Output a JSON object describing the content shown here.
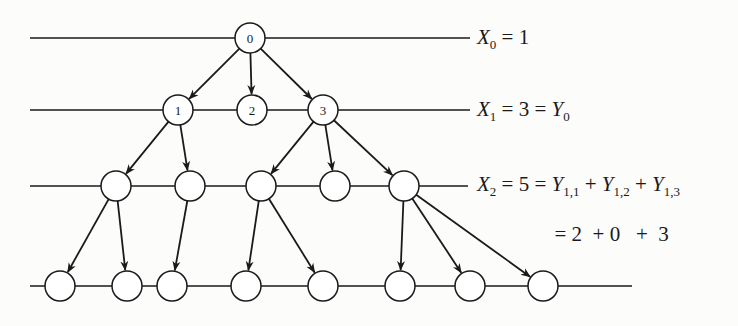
{
  "diagram": {
    "colors": {
      "line": "#1a1a1a",
      "background": "#fcfcfa",
      "node_fill": "#ffffff"
    },
    "generation_lines": [
      {
        "y": 38,
        "x1": 30,
        "x2": 470
      },
      {
        "y": 110,
        "x1": 30,
        "x2": 470
      },
      {
        "y": 186,
        "x1": 30,
        "x2": 468
      },
      {
        "y": 286,
        "x1": 30,
        "x2": 632
      }
    ],
    "nodes": [
      {
        "id": "n0",
        "label": "0",
        "x": 250,
        "y": 38
      },
      {
        "id": "n1",
        "label": "1",
        "x": 178,
        "y": 110
      },
      {
        "id": "n2",
        "label": "2",
        "x": 252,
        "y": 110
      },
      {
        "id": "n3",
        "label": "3",
        "x": 323,
        "y": 110
      },
      {
        "id": "a",
        "label": "",
        "x": 116,
        "y": 186
      },
      {
        "id": "b",
        "label": "",
        "x": 190,
        "y": 186
      },
      {
        "id": "c",
        "label": "",
        "x": 261,
        "y": 186
      },
      {
        "id": "d",
        "label": "",
        "x": 335,
        "y": 186
      },
      {
        "id": "e",
        "label": "",
        "x": 404,
        "y": 186
      },
      {
        "id": "f",
        "label": "",
        "x": 60,
        "y": 286
      },
      {
        "id": "g",
        "label": "",
        "x": 127,
        "y": 286
      },
      {
        "id": "h",
        "label": "",
        "x": 172,
        "y": 286
      },
      {
        "id": "i",
        "label": "",
        "x": 246,
        "y": 286
      },
      {
        "id": "j",
        "label": "",
        "x": 323,
        "y": 286
      },
      {
        "id": "k",
        "label": "",
        "x": 400,
        "y": 286
      },
      {
        "id": "l",
        "label": "",
        "x": 470,
        "y": 286
      },
      {
        "id": "m",
        "label": "",
        "x": 543,
        "y": 286
      }
    ],
    "edges": [
      [
        "n0",
        "n1"
      ],
      [
        "n0",
        "n2"
      ],
      [
        "n0",
        "n3"
      ],
      [
        "n1",
        "a"
      ],
      [
        "n1",
        "b"
      ],
      [
        "n3",
        "c"
      ],
      [
        "n3",
        "d"
      ],
      [
        "n3",
        "e"
      ],
      [
        "a",
        "f"
      ],
      [
        "a",
        "g"
      ],
      [
        "b",
        "h"
      ],
      [
        "c",
        "i"
      ],
      [
        "c",
        "j"
      ],
      [
        "e",
        "k"
      ],
      [
        "e",
        "l"
      ],
      [
        "e",
        "m"
      ]
    ],
    "labels": {
      "x0": {
        "var": "X",
        "sub": "0",
        "rest": " = 1"
      },
      "x1": {
        "var": "X",
        "sub": "1",
        "mid": " = 3 = ",
        "var2": "Y",
        "sub2": "0"
      },
      "x2": {
        "var": "X",
        "sub": "2",
        "mid": " = 5 = ",
        "terms": [
          {
            "var": "Y",
            "sub": "1,1"
          },
          {
            "var": "Y",
            "sub": "1,2"
          },
          {
            "var": "Y",
            "sub": "1,3"
          }
        ],
        "plus": " + "
      },
      "x2_values": "= 2  + 0   +  3"
    }
  }
}
